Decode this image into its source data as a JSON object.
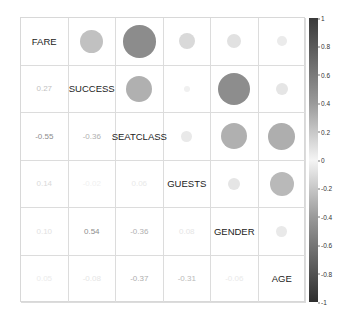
{
  "chart_data": {
    "type": "heatmap",
    "subtype": "correlation-matrix (upper: circles, lower: numbers)",
    "variables": [
      "FARE",
      "SUCCESS",
      "SEATCLASS",
      "GUESTS",
      "GENDER",
      "AGE"
    ],
    "matrix": [
      [
        1,
        0.27,
        -0.55,
        0.14,
        0.1,
        0.05
      ],
      [
        0.27,
        1,
        -0.36,
        -0.02,
        0.54,
        -0.08
      ],
      [
        -0.55,
        -0.36,
        1,
        0.06,
        -0.36,
        -0.37
      ],
      [
        0.14,
        -0.02,
        0.06,
        1,
        0.08,
        -0.31
      ],
      [
        0.1,
        0.54,
        -0.36,
        0.08,
        1,
        -0.06
      ],
      [
        0.05,
        -0.08,
        -0.37,
        -0.31,
        -0.06,
        1
      ]
    ],
    "colorbar": {
      "min": -1,
      "max": 1,
      "ticks": [
        "1",
        "0.8",
        "0.6",
        "0.4",
        "0.2",
        "0",
        "-0.2",
        "-0.4",
        "-0.6",
        "-0.8",
        "-1"
      ]
    },
    "title": "",
    "xlabel": "",
    "ylabel": ""
  }
}
